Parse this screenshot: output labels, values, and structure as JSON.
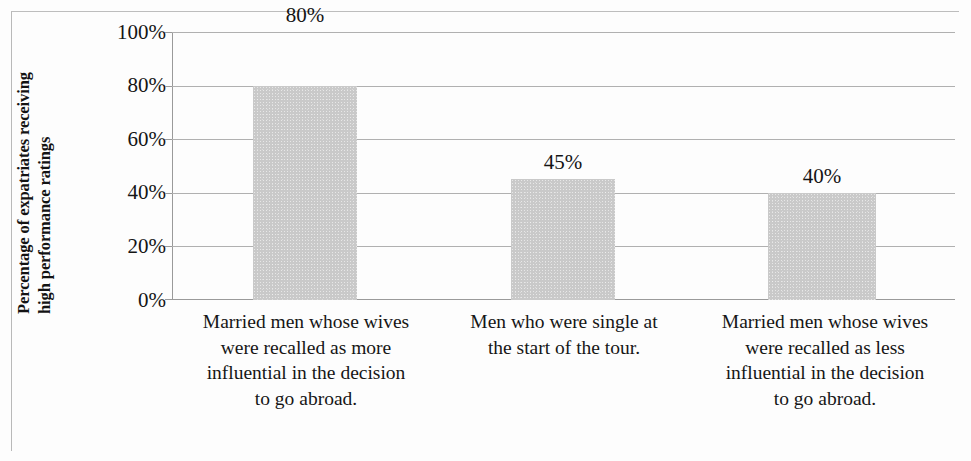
{
  "chart_data": {
    "type": "bar",
    "title": "",
    "subtitle": "",
    "xlabel": "",
    "ylabel_line1": "Percentage of expatriates receiving",
    "ylabel_line2": "high performance ratings",
    "categories": [
      "Married men whose wives were recalled as more influential in the decision to go abroad.",
      "Men who were single at the start of the tour.",
      "Married men whose wives were recalled as less influential in the decision to go abroad."
    ],
    "category_lines": [
      [
        "Married men whose wives",
        "were recalled as more",
        "influential in the decision",
        "to go abroad."
      ],
      [
        "Men who were single at",
        "the start of the tour.",
        "",
        ""
      ],
      [
        "Married men whose wives",
        "were recalled as less",
        "influential in the decision",
        "to go abroad."
      ]
    ],
    "values": [
      80,
      45,
      40
    ],
    "data_labels": [
      "80%",
      "45%",
      "40%"
    ],
    "ytick_labels": [
      "100%",
      "80%",
      "60%",
      "40%",
      "20%",
      "0%"
    ],
    "ytick_values": [
      100,
      80,
      60,
      40,
      20,
      0
    ],
    "ylim": [
      0,
      100
    ],
    "grid": true,
    "legend": false,
    "legend_position": "none",
    "bar_color": "#c9c9c9",
    "gridline_color": "#b0b0b0",
    "axis_color": "#9a9a9a",
    "text_color": "#141414"
  }
}
